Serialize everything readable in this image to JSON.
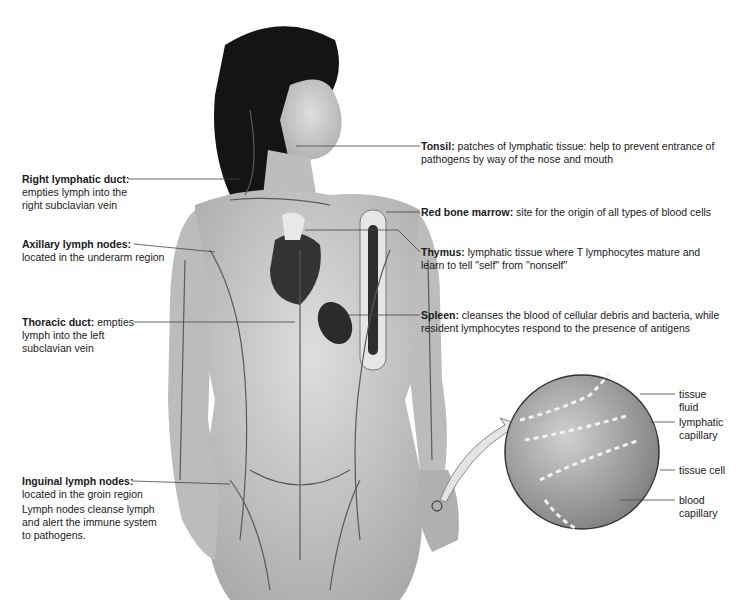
{
  "diagram": {
    "topic": "Lymphatic system",
    "labels_left": [
      {
        "term": "Right lymphatic duct:",
        "desc_inline": "",
        "desc": "empties lymph into the right subclavian vein",
        "lines": [
          "empties lymph into the",
          "right subclavian vein"
        ]
      },
      {
        "term": "Axillary lymph nodes:",
        "desc_inline": "",
        "desc": "located in the underarm region",
        "lines": [
          "located in the underarm region"
        ]
      },
      {
        "term": "Thoracic duct:",
        "desc_inline": "empties",
        "desc": "lymph into the left subclavian vein",
        "lines": [
          "lymph into the left",
          "subclavian vein"
        ]
      },
      {
        "term": "Inguinal lymph nodes:",
        "desc_inline": "",
        "desc": "located in the groin region",
        "lines": [
          "located in the groin region"
        ]
      }
    ],
    "note": {
      "lines": [
        "Lymph nodes cleanse lymph",
        "and alert the immune system",
        "to pathogens."
      ]
    },
    "labels_right": [
      {
        "term": "Tonsil:",
        "desc_inline": "patches of lymphatic tissue: help to prevent entrance of",
        "lines": [
          "pathogens by way of the nose and mouth"
        ]
      },
      {
        "term": "Red bone marrow:",
        "desc_inline": "site for the origin of all types of blood cells",
        "lines": []
      },
      {
        "term": "Thymus:",
        "desc_inline": "lymphatic tissue where T lymphocytes mature and",
        "lines": [
          "learn to tell \"self\" from \"nonself\""
        ]
      },
      {
        "term": "Spleen:",
        "desc_inline": "cleanses the blood of cellular debris and bacteria, while",
        "lines": [
          "resident lymphocytes respond to the presence of antigens"
        ]
      }
    ],
    "inset_labels": [
      {
        "lines": [
          "tissue",
          "fluid"
        ]
      },
      {
        "lines": [
          "lymphatic",
          "capillary"
        ]
      },
      {
        "lines": [
          "tissue cell"
        ]
      },
      {
        "lines": [
          "blood",
          "capillary"
        ]
      }
    ],
    "colors": {
      "background": "#ffffff",
      "hair": "#111111",
      "skin": "#c9c9c9",
      "vessels": "#5a5a5a",
      "heart": "#3a3a3a",
      "leader_lines": "#444444"
    }
  }
}
